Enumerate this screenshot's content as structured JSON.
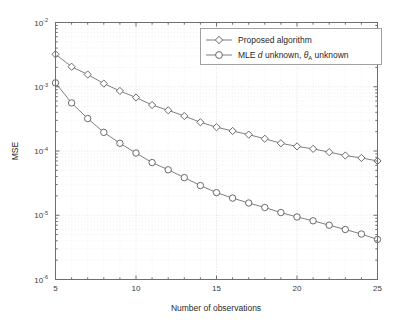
{
  "chart_data": {
    "type": "line",
    "title": "",
    "subtitle": "",
    "xlabel": "Number of observations",
    "ylabel": "MSE",
    "xscale": "linear",
    "yscale": "log",
    "xlim": [
      5,
      25
    ],
    "ylim": [
      1e-06,
      0.01
    ],
    "xticks": [
      5,
      10,
      15,
      20,
      25
    ],
    "xticklabels": [
      "5",
      "10",
      "15",
      "20",
      "25"
    ],
    "yticks": [
      1e-06,
      1e-05,
      0.0001,
      0.001,
      0.01
    ],
    "yticklabels": [
      "10^-6",
      "10^-5",
      "10^-4",
      "10^-3",
      "10^-2"
    ],
    "grid": true,
    "grid_minor": true,
    "legend_position": "top-right",
    "x": [
      5,
      6,
      7,
      8,
      9,
      10,
      11,
      12,
      13,
      14,
      15,
      16,
      17,
      18,
      19,
      20,
      21,
      22,
      23,
      24,
      25
    ],
    "series": [
      {
        "name": "Proposed algorithm",
        "marker": "diamond",
        "color": "#707070",
        "values": [
          0.0032,
          0.00205,
          0.00155,
          0.00112,
          0.00086,
          0.00068,
          0.00052,
          0.00043,
          0.00035,
          0.00028,
          0.000235,
          0.000205,
          0.00018,
          0.000155,
          0.000132,
          0.000118,
          0.000108,
          9.6e-05,
          8.5e-05,
          7.8e-05,
          7e-05
        ]
      },
      {
        "name": "MLE d unknown, theta_A unknown",
        "marker": "circle",
        "color": "#707070",
        "values": [
          0.00115,
          0.00056,
          0.00032,
          0.000195,
          0.000132,
          9.3e-05,
          6.6e-05,
          5.1e-05,
          3.85e-05,
          2.9e-05,
          2.25e-05,
          1.85e-05,
          1.55e-05,
          1.32e-05,
          1.1e-05,
          9.4e-06,
          8.2e-06,
          7e-06,
          6e-06,
          5.1e-06,
          4.2e-06
        ]
      }
    ]
  },
  "legend": {
    "entries": [
      {
        "label_plain": "Proposed algorithm",
        "marker": "diamond-marker"
      },
      {
        "label_prefix": "MLE ",
        "label_italic": "d",
        "label_mid": " unknown, ",
        "label_theta": "θ",
        "label_sub": "A",
        "label_suffix": " unknown",
        "marker": "circle-marker"
      }
    ]
  },
  "axes": {
    "ylabel": "MSE",
    "xlabel": "Number of observations",
    "ytick_base": "10",
    "ytick_exponents": [
      "-2",
      "-3",
      "-4",
      "-5",
      "-6"
    ],
    "xtick_labels": [
      "5",
      "10",
      "15",
      "20",
      "25"
    ]
  }
}
